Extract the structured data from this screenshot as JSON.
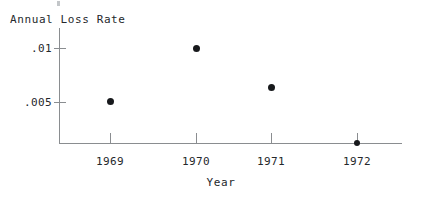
{
  "chart_data": {
    "type": "scatter",
    "title": "",
    "ylabel": "Annual Loss Rate",
    "xlabel": "Year",
    "categories": [
      "1969",
      "1970",
      "1971",
      "1972"
    ],
    "x": [
      1969,
      1970,
      1971,
      1972
    ],
    "values": [
      0.00505,
      0.01,
      0.00635,
      0.0
    ],
    "xtick_labels": [
      "1969",
      "1970",
      "1971",
      "1972"
    ],
    "ytick_labels": [
      ".01",
      ".005"
    ],
    "ytick_values": [
      0.01,
      0.005
    ],
    "ylim": [
      0,
      0.0107
    ],
    "xlim": [
      1968.4,
      1972.55
    ],
    "grid": false,
    "legend": null,
    "marker": "filled-circle",
    "marker_color": "#17191c",
    "axis_color": "#8a8d90",
    "background_color": "#ffffff",
    "points": [
      {
        "label": "1969",
        "x": 1969,
        "y": 0.00505
      },
      {
        "label": "1970",
        "x": 1970,
        "y": 0.01
      },
      {
        "label": "1971",
        "x": 1971,
        "y": 0.00635
      },
      {
        "label": "1972",
        "x": 1972,
        "y": 0.0
      }
    ]
  },
  "figure": {
    "ylabel_title": "Annual Loss Rate",
    "xlabel_title": "Year",
    "yticks": [
      {
        "label": ".01"
      },
      {
        "label": ".005"
      }
    ],
    "xticks": [
      {
        "label": "1969"
      },
      {
        "label": "1970"
      },
      {
        "label": "1971"
      },
      {
        "label": "1972"
      }
    ]
  }
}
